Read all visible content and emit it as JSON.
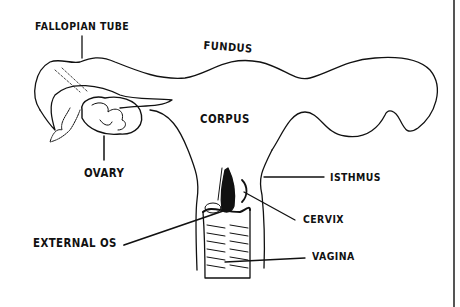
{
  "diagram": {
    "labels": {
      "fallopian_tube": "FALLOPIAN TUBE",
      "fundus": "FUNDUS",
      "corpus": "CORPUS",
      "ovary": "OVARY",
      "isthmus": "ISTHMUS",
      "cervix": "CERVIX",
      "external_os": "EXTERNAL OS",
      "vagina": "VAGINA"
    }
  }
}
